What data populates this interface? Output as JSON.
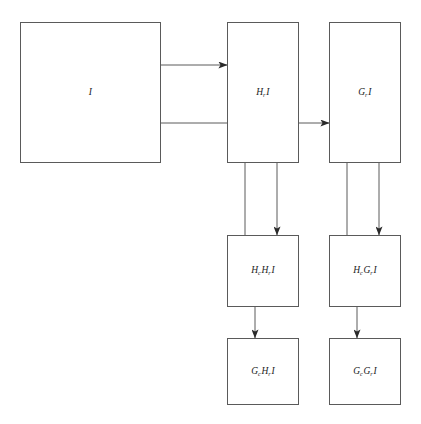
{
  "diagram": {
    "type": "block-diagram",
    "canvas": {
      "width": 421,
      "height": 424
    },
    "style": {
      "background_color": "#ffffff",
      "stroke_color": "#5a5a5a",
      "text_color": "#1d1d1d",
      "stroke_width": 1
    },
    "nodes": [
      {
        "id": "I",
        "label_plain": "I",
        "base": "I",
        "subscript": "",
        "operand": "",
        "x": 20,
        "y": 22,
        "width": 141,
        "height": 141
      },
      {
        "id": "HrI",
        "label_plain": "H_r I",
        "base": "H",
        "subscript": "r",
        "operand": "I",
        "x": 227,
        "y": 22,
        "width": 72,
        "height": 141
      },
      {
        "id": "GrI",
        "label_plain": "G_r I",
        "base": "G",
        "subscript": "r",
        "operand": "I",
        "x": 329,
        "y": 22,
        "width": 72,
        "height": 141
      },
      {
        "id": "HcHrI",
        "label_plain": "H_c H_r I",
        "base": "H",
        "subscript": "c",
        "base2": "H",
        "subscript2": "r",
        "operand": "I",
        "x": 227,
        "y": 235,
        "width": 72,
        "height": 72
      },
      {
        "id": "HcGrI",
        "label_plain": "H_c G_r I",
        "base": "H",
        "subscript": "c",
        "base2": "G",
        "subscript2": "r",
        "operand": "I",
        "x": 329,
        "y": 235,
        "width": 72,
        "height": 72
      },
      {
        "id": "GcHrI",
        "label_plain": "G_c H_r I",
        "base": "G",
        "subscript": "c",
        "base2": "H",
        "subscript2": "r",
        "operand": "I",
        "x": 227,
        "y": 338,
        "width": 72,
        "height": 67
      },
      {
        "id": "GcGrI",
        "label_plain": "G_c G_r I",
        "base": "G",
        "subscript": "c",
        "base2": "G",
        "subscript2": "r",
        "operand": "I",
        "x": 329,
        "y": 338,
        "width": 72,
        "height": 67
      }
    ],
    "edges": [
      {
        "id": "edge-I-to-HrI",
        "from": "I",
        "to": "HrI",
        "orientation": "horizontal",
        "arrowhead": true
      },
      {
        "id": "edge-I-to-GrI",
        "from": "I",
        "to": "GrI",
        "orientation": "horizontal",
        "arrowhead": true,
        "passes_through": "HrI"
      },
      {
        "id": "edge-HrI-tap-left",
        "from": "HrI",
        "to": "HcHrI",
        "orientation": "vertical",
        "arrowhead": false
      },
      {
        "id": "edge-HrI-to-HcHrI",
        "from": "HrI",
        "to": "HcHrI",
        "orientation": "vertical",
        "arrowhead": true
      },
      {
        "id": "edge-GrI-tap-left",
        "from": "GrI",
        "to": "HcGrI",
        "orientation": "vertical",
        "arrowhead": false
      },
      {
        "id": "edge-GrI-to-HcGrI",
        "from": "GrI",
        "to": "HcGrI",
        "orientation": "vertical",
        "arrowhead": true
      },
      {
        "id": "edge-HcHrI-to-GcHrI",
        "from": "HcHrI",
        "to": "GcHrI",
        "orientation": "vertical",
        "arrowhead": true
      },
      {
        "id": "edge-HcGrI-to-GcGrI",
        "from": "HcGrI",
        "to": "GcGrI",
        "orientation": "vertical",
        "arrowhead": true
      }
    ]
  }
}
